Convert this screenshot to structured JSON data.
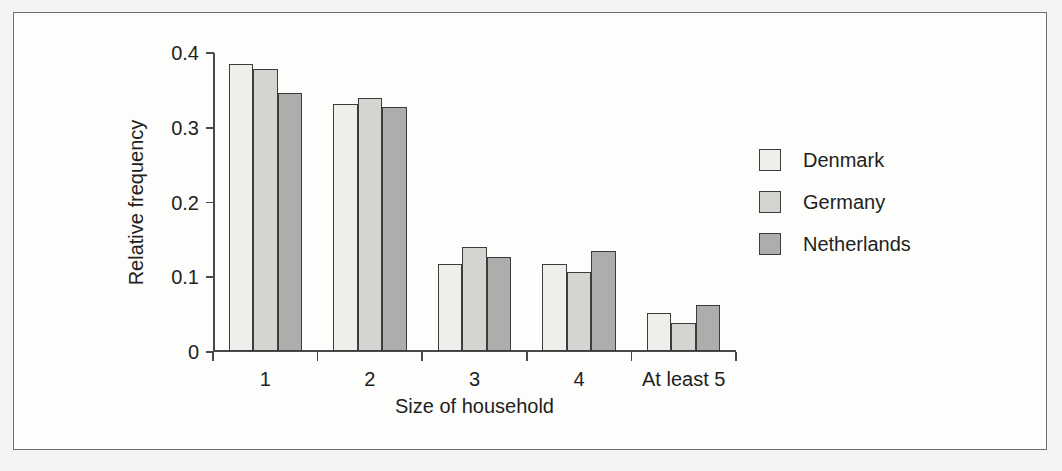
{
  "figure": {
    "background_color": "#f4f4f2",
    "panel_color": "#fdfdfc",
    "frame_color": "#6d6f71"
  },
  "chart_data": {
    "type": "bar",
    "title": "",
    "subtitle": "",
    "xlabel": "Size of household",
    "ylabel": "Relative frequency",
    "categories": [
      "1",
      "2",
      "3",
      "4",
      "At least 5"
    ],
    "series": [
      {
        "name": "Denmark",
        "color": "#eeeeea",
        "values": [
          0.384,
          0.331,
          0.116,
          0.116,
          0.051
        ]
      },
      {
        "name": "Germany",
        "color": "#d4d4d0",
        "values": [
          0.377,
          0.338,
          0.139,
          0.106,
          0.037
        ]
      },
      {
        "name": "Netherlands",
        "color": "#adadab",
        "values": [
          0.345,
          0.327,
          0.126,
          0.134,
          0.062
        ]
      }
    ],
    "ylim": [
      0,
      0.4
    ],
    "yticks": [
      0,
      0.1,
      0.2,
      0.3,
      0.4
    ],
    "ytick_labels": [
      "0",
      "0.1",
      "0.2",
      "0.3",
      "0.4"
    ],
    "grid": false,
    "legend_position": "right",
    "bar_edge_color": "#3b3c3e"
  }
}
